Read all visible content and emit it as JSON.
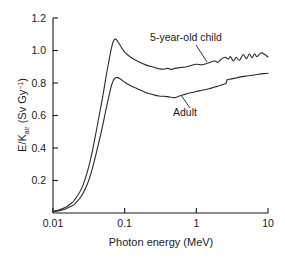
{
  "chart_data": {
    "type": "line",
    "title": "",
    "subtitle": "",
    "xlabel": "Photon energy (MeV)",
    "ylabel_parts": {
      "main_a": "E/K",
      "subscript": "air",
      "main_b": " (Sv Gy",
      "superscript": "−1",
      "main_c": ")"
    },
    "ylabel": "E/Kair (Sv Gy−1)",
    "xscale": "log",
    "yscale": "linear",
    "xlim": [
      0.01,
      10
    ],
    "ylim": [
      0,
      1.2
    ],
    "grid": false,
    "legend_position": "inline-annotations",
    "xticks": [
      0.01,
      0.1,
      1,
      10
    ],
    "xtick_labels": [
      "0.01",
      "0.1",
      "1",
      "10"
    ],
    "yticks": [
      0.2,
      0.4,
      0.6,
      0.8,
      1.0,
      1.2
    ],
    "ytick_labels": [
      "0.2",
      "0.4",
      "0.6",
      "0.8",
      "1.0",
      "1.2"
    ],
    "series": [
      {
        "name": "5-year-old child",
        "label": "5-year-old child",
        "color": "#2b2b2b",
        "x": [
          0.01,
          0.012,
          0.015,
          0.018,
          0.02,
          0.025,
          0.03,
          0.035,
          0.04,
          0.045,
          0.05,
          0.055,
          0.06,
          0.065,
          0.07,
          0.075,
          0.08,
          0.09,
          0.1,
          0.12,
          0.15,
          0.2,
          0.25,
          0.3,
          0.35,
          0.4,
          0.45,
          0.5,
          0.6,
          0.7,
          0.8,
          1.0,
          1.2,
          1.5,
          1.8,
          2.0,
          2.2,
          2.5,
          2.8,
          3.0,
          3.3,
          3.6,
          4.0,
          4.5,
          5.0,
          5.5,
          6.0,
          6.5,
          7.0,
          8.0,
          9.0,
          10.0
        ],
        "y": [
          0.01,
          0.018,
          0.035,
          0.06,
          0.08,
          0.15,
          0.25,
          0.37,
          0.5,
          0.62,
          0.73,
          0.84,
          0.93,
          1.01,
          1.06,
          1.07,
          1.055,
          1.02,
          0.99,
          0.96,
          0.935,
          0.91,
          0.898,
          0.888,
          0.885,
          0.89,
          0.884,
          0.89,
          0.895,
          0.898,
          0.905,
          0.915,
          0.912,
          0.925,
          0.935,
          0.928,
          0.945,
          0.958,
          0.948,
          0.962,
          0.935,
          0.958,
          0.94,
          0.975,
          0.95,
          0.978,
          0.955,
          0.98,
          0.962,
          0.985,
          0.975,
          0.96
        ]
      },
      {
        "name": "Adult",
        "label": "Adult",
        "color": "#2b2b2b",
        "x": [
          0.01,
          0.012,
          0.015,
          0.018,
          0.02,
          0.025,
          0.03,
          0.035,
          0.04,
          0.045,
          0.05,
          0.055,
          0.06,
          0.065,
          0.07,
          0.075,
          0.08,
          0.085,
          0.09,
          0.1,
          0.12,
          0.15,
          0.2,
          0.25,
          0.3,
          0.35,
          0.4,
          0.45,
          0.5,
          0.55,
          0.6,
          0.7,
          0.8,
          1.0,
          1.2,
          1.5,
          1.8,
          2.0,
          2.2,
          2.4,
          2.6,
          2.7,
          3.0,
          3.5,
          4.0,
          5.0,
          6.0,
          7.0,
          8.0,
          9.0,
          10.0
        ],
        "y": [
          0.008,
          0.013,
          0.025,
          0.042,
          0.055,
          0.105,
          0.175,
          0.265,
          0.365,
          0.46,
          0.55,
          0.64,
          0.715,
          0.78,
          0.818,
          0.832,
          0.833,
          0.828,
          0.82,
          0.805,
          0.785,
          0.765,
          0.74,
          0.728,
          0.72,
          0.718,
          0.716,
          0.712,
          0.71,
          0.716,
          0.722,
          0.73,
          0.738,
          0.748,
          0.755,
          0.765,
          0.775,
          0.78,
          0.786,
          0.792,
          0.798,
          0.82,
          0.824,
          0.83,
          0.836,
          0.843,
          0.848,
          0.852,
          0.856,
          0.858,
          0.86
        ]
      }
    ],
    "annotations": [
      {
        "name": "child-annotation",
        "text": "5-year-old child",
        "text_x": 186,
        "text_y": 41,
        "leader": {
          "x1": 196,
          "y1": 45,
          "x2": 207,
          "y2": 62
        }
      },
      {
        "name": "adult-annotation",
        "text": "Adult",
        "text_x": 185,
        "text_y": 116,
        "leader": {
          "x1": 190,
          "y1": 108,
          "x2": 181,
          "y2": 95
        }
      }
    ]
  }
}
